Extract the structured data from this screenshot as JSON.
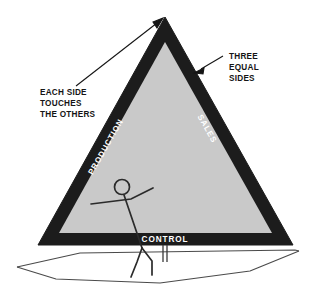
{
  "diagram": {
    "colors": {
      "band": "#1c1c1c",
      "fill": "#c9c9c9",
      "annotation_text": "#151515",
      "label_text": "#ffffff",
      "line": "#3a3a3a",
      "background": "#ffffff"
    },
    "triangle": {
      "sides": [
        {
          "id": "production",
          "label": "PRODUCTION",
          "position": "left-edge",
          "orientation": "bottom-to-top"
        },
        {
          "id": "sales",
          "label": "SALES",
          "position": "right-edge",
          "orientation": "top-to-bottom"
        },
        {
          "id": "control",
          "label": "CONTROL",
          "position": "bottom-edge",
          "orientation": "horizontal"
        }
      ]
    },
    "annotations": [
      {
        "id": "three-equal-sides",
        "lines": [
          "THREE",
          "EQUAL",
          "SIDES"
        ],
        "points_to": "right side of triangle"
      },
      {
        "id": "each-side-touches-the-others",
        "lines": [
          "EACH SIDE",
          "TOUCHES",
          "THE OTHERS"
        ],
        "points_to": "apex of triangle"
      }
    ],
    "figures": [
      {
        "id": "sailor",
        "description": "stick figure sailor with outstretched arms"
      },
      {
        "id": "boat-hull",
        "description": "sailboat hull outline"
      },
      {
        "id": "mast-post",
        "description": "short vertical post at boom"
      }
    ]
  }
}
